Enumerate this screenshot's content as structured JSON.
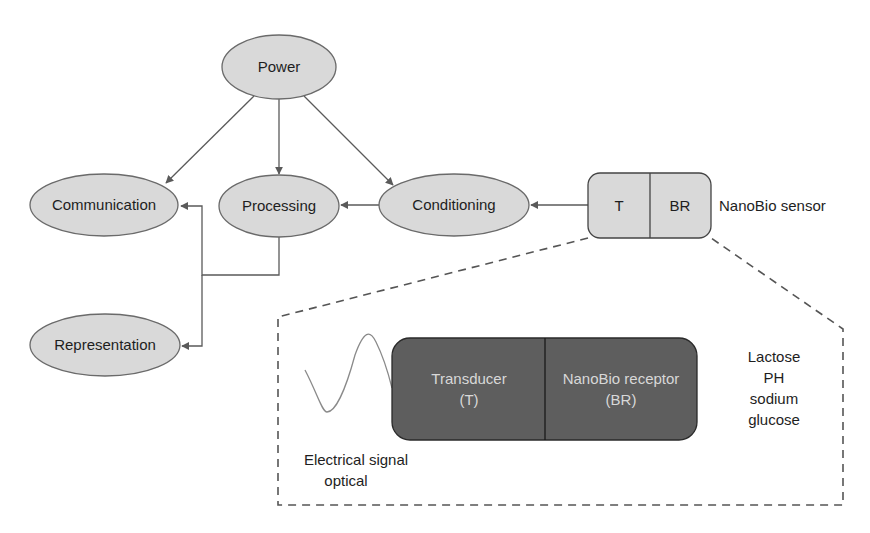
{
  "diagram": {
    "nodes": {
      "power": {
        "label": "Power"
      },
      "communication": {
        "label": "Communication"
      },
      "processing": {
        "label": "Processing"
      },
      "conditioning": {
        "label": "Conditioning"
      },
      "representation": {
        "label": "Representation"
      }
    },
    "sensor": {
      "t_label": "T",
      "br_label": "BR",
      "caption": "NanoBio sensor"
    },
    "detail": {
      "transducer_line1": "Transducer",
      "transducer_line2": "(T)",
      "receptor_line1": "NanoBio receptor",
      "receptor_line2": "(BR)",
      "analytes": [
        "Lactose",
        "PH",
        "sodium",
        "glucose"
      ],
      "signal_line1": "Electrical signal",
      "signal_line2": "optical"
    },
    "edges": [
      {
        "from": "Power",
        "to": "Communication"
      },
      {
        "from": "Power",
        "to": "Processing"
      },
      {
        "from": "Power",
        "to": "Conditioning"
      },
      {
        "from": "NanoBio sensor",
        "to": "Conditioning"
      },
      {
        "from": "Conditioning",
        "to": "Processing"
      },
      {
        "from": "Processing",
        "to": "Communication"
      },
      {
        "from": "Processing",
        "to": "Representation"
      }
    ],
    "colors": {
      "node_fill": "#d9d9d9",
      "node_stroke": "#6a6a6a",
      "detail_box_fill": "#5e5e5e",
      "detail_text": "#d8d8d8",
      "edge": "#5a5a5a"
    }
  }
}
